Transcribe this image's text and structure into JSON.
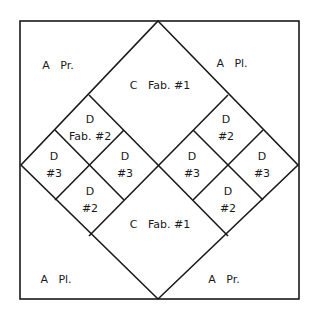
{
  "diagram": {
    "line_color": "#1a1a1a",
    "background": "#ffffff",
    "frame": {
      "x1": 20,
      "y1": 21,
      "x2": 299,
      "y2": 299
    },
    "large_diamond": {
      "top": [
        158,
        21
      ],
      "right": [
        298,
        165
      ],
      "bottom": [
        158,
        299
      ],
      "left": [
        21,
        165
      ]
    },
    "cross_lines": [
      {
        "from": [
          89,
          95
        ],
        "to": [
          228,
          236
        ]
      },
      {
        "from": [
          228,
          95
        ],
        "to": [
          89,
          236
        ]
      }
    ],
    "small_diamonds": [
      {
        "name": "left",
        "top": [
          89,
          95
        ],
        "right": [
          159,
          165
        ],
        "bottom": [
          89,
          236
        ],
        "left": [
          21,
          165
        ]
      },
      {
        "name": "right",
        "top": [
          228,
          95
        ],
        "right": [
          298,
          165
        ],
        "bottom": [
          228,
          236
        ],
        "left": [
          159,
          165
        ]
      }
    ],
    "pieces": [
      {
        "id": "a-pr-top-left",
        "text": "A   Pr.",
        "x": 58,
        "y": 65
      },
      {
        "id": "c-fab1-top",
        "text": "C   Fab. #1",
        "x": 160,
        "y": 85
      },
      {
        "id": "a-pl-top-right",
        "text": "A   Pl.",
        "x": 232,
        "y": 63
      },
      {
        "id": "d-fab2-left-top",
        "text": "D\nFab. #2",
        "x": 90,
        "y": 128
      },
      {
        "id": "d3-left-outer",
        "text": "D\n#3",
        "x": 54,
        "y": 165
      },
      {
        "id": "d3-left-inner",
        "text": "D\n#3",
        "x": 125,
        "y": 165
      },
      {
        "id": "d2-left-bottom",
        "text": "D\n#2",
        "x": 90,
        "y": 200
      },
      {
        "id": "d2-right-top",
        "text": "D\n#2",
        "x": 226,
        "y": 128
      },
      {
        "id": "d3-right-inner",
        "text": "D\n#3",
        "x": 192,
        "y": 165
      },
      {
        "id": "d3-right-outer",
        "text": "D\n#3",
        "x": 262,
        "y": 165
      },
      {
        "id": "d2-right-bottom",
        "text": "D\n#2",
        "x": 228,
        "y": 200
      },
      {
        "id": "c-fab1-bottom",
        "text": "C   Fab. #1",
        "x": 160,
        "y": 224
      },
      {
        "id": "a-pl-bottom-left",
        "text": "A   Pl.",
        "x": 56,
        "y": 279
      },
      {
        "id": "a-pr-bottom-right",
        "text": "A   Pr.",
        "x": 224,
        "y": 279
      }
    ]
  }
}
